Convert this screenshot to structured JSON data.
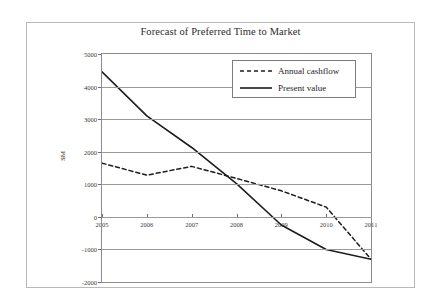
{
  "chart_data": {
    "type": "line",
    "title": "Forecast of Preferred Time to Market",
    "xlabel": "",
    "ylabel": "$M",
    "x": [
      2005,
      2006,
      2007,
      2008,
      2009,
      2010,
      2011
    ],
    "xtick_labels": [
      "2005",
      "2006",
      "2007",
      "2008",
      "2009",
      "2010",
      "2011"
    ],
    "ytick_labels": [
      "5000",
      "4000",
      "3000",
      "2000",
      "1000",
      "0",
      "-1000",
      "-2000"
    ],
    "ytick_values": [
      5000,
      4000,
      3000,
      2000,
      1000,
      0,
      -1000,
      -2000
    ],
    "xlim": [
      2005,
      2011
    ],
    "ylim": [
      -2000,
      5000
    ],
    "grid": true,
    "legend_position": "upper right",
    "series": [
      {
        "name": "Annual cashflow",
        "style": "dashed",
        "color": "#1d1d1d",
        "values": [
          1650,
          1280,
          1550,
          1180,
          800,
          300,
          -1300
        ]
      },
      {
        "name": "Present value",
        "style": "solid",
        "color": "#1d1d1d",
        "values": [
          4450,
          3100,
          2130,
          1020,
          -250,
          -1000,
          -1300
        ]
      }
    ]
  },
  "legend": {
    "entries": [
      {
        "label": "Annual cashflow"
      },
      {
        "label": "Present value"
      }
    ]
  },
  "axes": {
    "y_title": "$M"
  }
}
